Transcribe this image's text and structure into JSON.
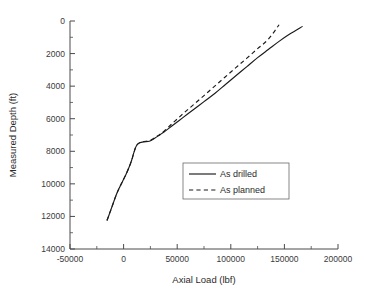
{
  "chart_data": {
    "type": "line",
    "title": "",
    "xlabel": "Axial Load (lbf)",
    "ylabel": "Measured Depth (ft)",
    "xlim": [
      -50000,
      200000
    ],
    "ylim": [
      0,
      14000
    ],
    "y_inverted": true,
    "grid": false,
    "legend_position": "center-right",
    "xticks": [
      -50000,
      0,
      50000,
      100000,
      150000,
      200000
    ],
    "xtick_labels": [
      "-50000",
      "0",
      "50000",
      "100000",
      "150000",
      "200000"
    ],
    "x_minor_ticks": [
      -25000,
      25000,
      75000,
      125000,
      175000
    ],
    "yticks": [
      0,
      2000,
      4000,
      6000,
      8000,
      10000,
      12000,
      14000
    ],
    "ytick_labels": [
      "0",
      "2000",
      "4000",
      "6000",
      "8000",
      "10000",
      "12000",
      "14000"
    ],
    "y_minor_ticks": [
      1000,
      3000,
      5000,
      7000,
      9000,
      11000,
      13000
    ],
    "series": [
      {
        "name": "As drilled",
        "style": "solid",
        "color": "#1a1a1a",
        "points": [
          [
            -15500,
            12250
          ],
          [
            -13000,
            11800
          ],
          [
            -10000,
            11250
          ],
          [
            -7000,
            10700
          ],
          [
            -4000,
            10250
          ],
          [
            -1000,
            9850
          ],
          [
            2000,
            9450
          ],
          [
            5000,
            9000
          ],
          [
            7500,
            8550
          ],
          [
            9500,
            8100
          ],
          [
            11000,
            7800
          ],
          [
            12500,
            7600
          ],
          [
            15000,
            7480
          ],
          [
            19000,
            7420
          ],
          [
            24000,
            7380
          ],
          [
            29000,
            7200
          ],
          [
            34000,
            6980
          ],
          [
            38000,
            6800
          ],
          [
            45000,
            6450
          ],
          [
            55000,
            5950
          ],
          [
            65000,
            5450
          ],
          [
            75000,
            4950
          ],
          [
            85000,
            4450
          ],
          [
            95000,
            3900
          ],
          [
            105000,
            3350
          ],
          [
            115000,
            2800
          ],
          [
            125000,
            2250
          ],
          [
            135000,
            1750
          ],
          [
            145000,
            1250
          ],
          [
            155000,
            800
          ],
          [
            167000,
            330
          ]
        ]
      },
      {
        "name": "As planned",
        "style": "dashed",
        "color": "#1a1a1a",
        "points": [
          [
            -15500,
            12250
          ],
          [
            -13000,
            11800
          ],
          [
            -10000,
            11250
          ],
          [
            -7000,
            10700
          ],
          [
            -4000,
            10250
          ],
          [
            -1000,
            9850
          ],
          [
            2000,
            9450
          ],
          [
            5000,
            9000
          ],
          [
            7500,
            8550
          ],
          [
            9500,
            8100
          ],
          [
            11000,
            7800
          ],
          [
            12500,
            7600
          ],
          [
            15000,
            7470
          ],
          [
            19000,
            7400
          ],
          [
            24000,
            7350
          ],
          [
            29000,
            7170
          ],
          [
            34000,
            6950
          ],
          [
            38000,
            6750
          ],
          [
            45000,
            6320
          ],
          [
            55000,
            5720
          ],
          [
            65000,
            5150
          ],
          [
            75000,
            4580
          ],
          [
            85000,
            4000
          ],
          [
            95000,
            3420
          ],
          [
            105000,
            2850
          ],
          [
            115000,
            2280
          ],
          [
            125000,
            1700
          ],
          [
            135000,
            1120
          ],
          [
            145000,
            230
          ]
        ]
      }
    ]
  },
  "legend": {
    "entries": [
      {
        "label": "As drilled",
        "style": "solid"
      },
      {
        "label": "As planned",
        "style": "dashed"
      }
    ]
  }
}
